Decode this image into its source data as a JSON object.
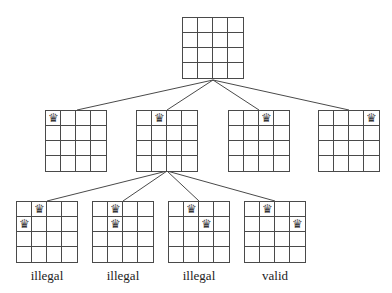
{
  "diagram": {
    "type": "search-tree",
    "queen_glyph": "♛",
    "board_size": 4,
    "line_color": "#4a4a4a",
    "root": {
      "queens": []
    },
    "level1": [
      {
        "queens": [
          [
            0,
            0
          ]
        ]
      },
      {
        "queens": [
          [
            0,
            1
          ]
        ]
      },
      {
        "queens": [
          [
            0,
            2
          ]
        ]
      },
      {
        "queens": [
          [
            0,
            3
          ]
        ]
      }
    ],
    "level2": [
      {
        "queens": [
          [
            0,
            1
          ],
          [
            1,
            0
          ]
        ],
        "label": "illegal"
      },
      {
        "queens": [
          [
            0,
            1
          ],
          [
            1,
            1
          ]
        ],
        "label": "illegal"
      },
      {
        "queens": [
          [
            0,
            1
          ],
          [
            1,
            2
          ]
        ],
        "label": "illegal"
      },
      {
        "queens": [
          [
            0,
            1
          ],
          [
            1,
            3
          ]
        ],
        "label": "valid"
      }
    ]
  }
}
